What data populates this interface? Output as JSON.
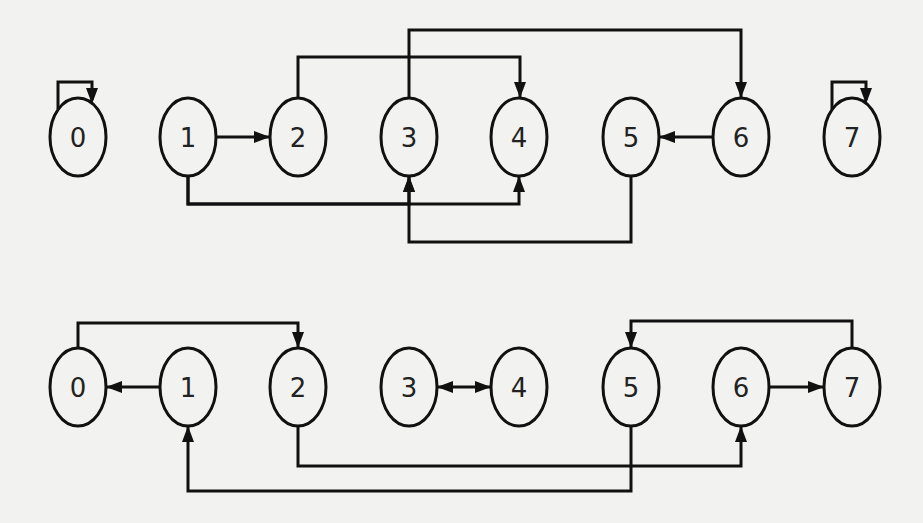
{
  "diagram": {
    "type": "directed-graph",
    "style": {
      "stroke_color": "#111111",
      "background": "#f2f2f0",
      "node_rx": 28,
      "node_ry": 39
    },
    "graphs": [
      {
        "id": "top",
        "center_y": 137,
        "nodes": [
          {
            "id": "0",
            "label": "0",
            "x": 78
          },
          {
            "id": "1",
            "label": "1",
            "x": 188
          },
          {
            "id": "2",
            "label": "2",
            "x": 298
          },
          {
            "id": "3",
            "label": "3",
            "x": 409
          },
          {
            "id": "4",
            "label": "4",
            "x": 519
          },
          {
            "id": "5",
            "label": "5",
            "x": 631
          },
          {
            "id": "6",
            "label": "6",
            "x": 741
          },
          {
            "id": "7",
            "label": "7",
            "x": 852
          }
        ],
        "edges": [
          {
            "from": "0",
            "to": "0",
            "kind": "self-loop",
            "route": "top"
          },
          {
            "from": "1",
            "to": "2",
            "kind": "straight"
          },
          {
            "from": "2",
            "to": "4",
            "kind": "orthogonal",
            "route": "above",
            "level_y": 57
          },
          {
            "from": "3",
            "to": "6",
            "kind": "orthogonal",
            "route": "above",
            "level_y": 30
          },
          {
            "from": "6",
            "to": "5",
            "kind": "straight"
          },
          {
            "from": "7",
            "to": "7",
            "kind": "self-loop",
            "route": "top"
          },
          {
            "from": "1",
            "to": "3",
            "kind": "orthogonal",
            "route": "below",
            "level_y": 204
          },
          {
            "from": "1",
            "to": "4",
            "kind": "orthogonal",
            "route": "below",
            "level_y": 204
          },
          {
            "from": "5",
            "to": "3",
            "kind": "orthogonal",
            "route": "below",
            "level_y": 242
          }
        ]
      },
      {
        "id": "bottom",
        "center_y": 387,
        "nodes": [
          {
            "id": "0",
            "label": "0",
            "x": 78
          },
          {
            "id": "1",
            "label": "1",
            "x": 188
          },
          {
            "id": "2",
            "label": "2",
            "x": 298
          },
          {
            "id": "3",
            "label": "3",
            "x": 409
          },
          {
            "id": "4",
            "label": "4",
            "x": 519
          },
          {
            "id": "5",
            "label": "5",
            "x": 631
          },
          {
            "id": "6",
            "label": "6",
            "x": 741
          },
          {
            "id": "7",
            "label": "7",
            "x": 852
          }
        ],
        "edges": [
          {
            "from": "0",
            "to": "2",
            "kind": "orthogonal",
            "route": "above",
            "level_y": 323
          },
          {
            "from": "1",
            "to": "0",
            "kind": "straight"
          },
          {
            "from": "3",
            "to": "4",
            "kind": "straight",
            "bidirectional": true
          },
          {
            "from": "2",
            "to": "6",
            "kind": "orthogonal",
            "route": "below",
            "level_y": 466
          },
          {
            "from": "5",
            "to": "1",
            "kind": "orthogonal",
            "route": "below",
            "level_y": 491
          },
          {
            "from": "6",
            "to": "7",
            "kind": "straight"
          },
          {
            "from": "7",
            "to": "5",
            "kind": "orthogonal",
            "route": "above",
            "level_y": 321
          }
        ]
      }
    ]
  }
}
